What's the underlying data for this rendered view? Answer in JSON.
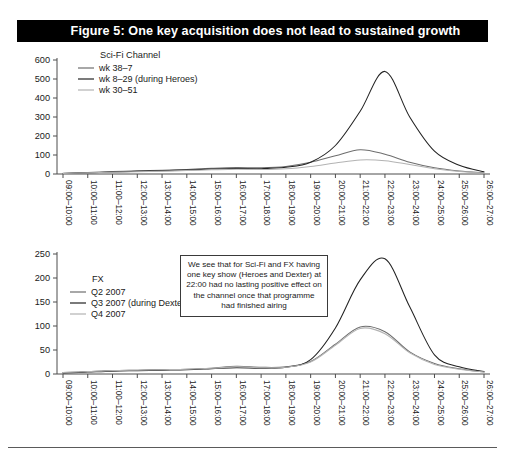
{
  "figure": {
    "title": "Figure 5: One key acquisition does not lead to sustained growth",
    "title_bar_color": "#000000",
    "title_text_color": "#ffffff"
  },
  "annotation": {
    "name": "insight-callout",
    "text": "We see that for Sci-Fi and FX having one key show (Heroes and Dexter) at 22:00 had no lasting positive effect on the channel once that programme had finished airing"
  },
  "colors": {
    "series_mid_gray": "#6e6e6e",
    "series_dark": "#222222",
    "series_light_gray": "#b3b3b3",
    "axis": "#4d4d4d"
  },
  "chart_data": [
    {
      "type": "line",
      "title": "Sci-Fi Channel",
      "xlabel": "",
      "ylabel": "",
      "ylim": [
        0,
        600
      ],
      "yticks": [
        0,
        100,
        200,
        300,
        400,
        500,
        600
      ],
      "grid": false,
      "legend_position": "top-left",
      "categories": [
        "09:00–10:00",
        "10:00–11:00",
        "11:00–12:00",
        "12:00–13:00",
        "13:00–14:00",
        "14:00–15:00",
        "15:00–16:00",
        "16:00–17:00",
        "17:00–18:00",
        "18:00–19:00",
        "19:00–20:00",
        "20:00–21:00",
        "21:00–22:00",
        "22:00–23:00",
        "23:00–24:00",
        "24:00–25:00",
        "25:00–26:00",
        "26:00–27:00"
      ],
      "series": [
        {
          "name": "wk 38–7",
          "color": "#6e6e6e",
          "values": [
            4,
            8,
            13,
            17,
            20,
            24,
            30,
            34,
            33,
            40,
            62,
            96,
            128,
            104,
            62,
            33,
            16,
            6
          ]
        },
        {
          "name": "wk 8–29 (during Heroes)",
          "color": "#222222",
          "values": [
            3,
            6,
            10,
            14,
            17,
            21,
            26,
            29,
            28,
            35,
            62,
            150,
            330,
            540,
            300,
            120,
            46,
            12
          ]
        },
        {
          "name": "wk 30–51",
          "color": "#b3b3b3",
          "values": [
            3,
            6,
            9,
            12,
            15,
            18,
            22,
            25,
            24,
            28,
            40,
            58,
            74,
            70,
            50,
            28,
            13,
            5
          ]
        }
      ]
    },
    {
      "type": "line",
      "title": "FX",
      "xlabel": "",
      "ylabel": "",
      "ylim": [
        0,
        250
      ],
      "yticks": [
        0,
        50,
        100,
        150,
        200,
        250
      ],
      "grid": false,
      "legend_position": "top-left",
      "categories": [
        "09:00–10:00",
        "10:00–11:00",
        "11:00–12:00",
        "12:00–13:00",
        "13:00–14:00",
        "14:00–15:00",
        "15:00–16:00",
        "16:00–17:00",
        "17:00–18:00",
        "18:00–19:00",
        "19:00–20:00",
        "20:00–21:00",
        "21:00–22:00",
        "22:00–23:00",
        "23:00–24:00",
        "24:00–25:00",
        "25:00–26:00",
        "26:00–27:00"
      ],
      "series": [
        {
          "name": "Q2 2007",
          "color": "#6e6e6e",
          "values": [
            3,
            5,
            7,
            8,
            9,
            10,
            12,
            16,
            14,
            15,
            26,
            62,
            98,
            88,
            46,
            22,
            11,
            4
          ]
        },
        {
          "name": "Q3 2007 (during Dexter)",
          "color": "#222222",
          "values": [
            2,
            4,
            6,
            7,
            8,
            9,
            11,
            13,
            12,
            14,
            30,
            96,
            196,
            240,
            140,
            40,
            15,
            5
          ]
        },
        {
          "name": "Q4 2007",
          "color": "#b3b3b3",
          "values": [
            3,
            5,
            7,
            8,
            9,
            10,
            12,
            15,
            13,
            14,
            25,
            60,
            95,
            84,
            44,
            20,
            10,
            4
          ]
        }
      ]
    }
  ]
}
